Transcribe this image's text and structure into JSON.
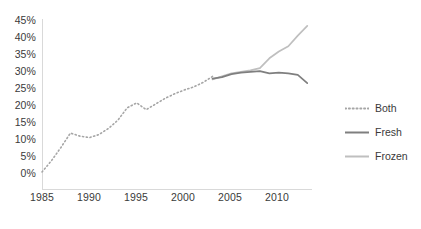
{
  "chart_data": {
    "type": "line",
    "title": "",
    "subtitle": "",
    "xlabel": "",
    "ylabel": "",
    "xlim": [
      1985,
      2013.5
    ],
    "ylim": [
      0,
      45
    ],
    "grid": false,
    "legend_position": "right",
    "x_tick_labels": [
      "1985",
      "1990",
      "1995",
      "2000",
      "2005",
      "2010"
    ],
    "x_ticks": [
      1985,
      1990,
      1995,
      2000,
      2005,
      2010
    ],
    "y_tick_labels": [
      "0%",
      "5%",
      "10%",
      "15%",
      "20%",
      "25%",
      "30%",
      "35%",
      "40%",
      "45%"
    ],
    "y_ticks": [
      0,
      5,
      10,
      15,
      20,
      25,
      30,
      35,
      40,
      45
    ],
    "series": [
      {
        "name": "Both",
        "style": "dotted",
        "color": "#a6a6a6",
        "x": [
          1985,
          1986,
          1987,
          1988,
          1989,
          1990,
          1991,
          1992,
          1993,
          1994,
          1995,
          1996,
          1997,
          1998,
          1999,
          2000,
          2001,
          2002,
          2003
        ],
        "values": [
          4.5,
          7.5,
          11.0,
          14.8,
          14.0,
          13.6,
          14.4,
          16.0,
          18.2,
          21.5,
          22.8,
          21.0,
          22.5,
          24.0,
          25.2,
          26.2,
          27.0,
          28.2,
          29.8
        ]
      },
      {
        "name": "Fresh",
        "style": "solid",
        "color": "#7f7f7f",
        "x": [
          2003,
          2004,
          2005,
          2006,
          2007,
          2008,
          2009,
          2010,
          2011,
          2012,
          2013
        ],
        "values": [
          29.2,
          29.6,
          30.4,
          30.8,
          31.0,
          31.2,
          30.6,
          30.8,
          30.6,
          30.2,
          28.0
        ]
      },
      {
        "name": "Frozen",
        "style": "solid",
        "color": "#bfbfbf",
        "x": [
          2003,
          2004,
          2005,
          2006,
          2007,
          2008,
          2009,
          2010,
          2011,
          2012,
          2013
        ],
        "values": [
          29.0,
          29.8,
          30.6,
          31.0,
          31.4,
          32.0,
          34.6,
          36.4,
          37.8,
          40.6,
          43.2
        ]
      }
    ]
  },
  "legend": {
    "items": [
      {
        "label": "Both"
      },
      {
        "label": "Fresh"
      },
      {
        "label": "Frozen"
      }
    ]
  },
  "axes": {
    "y_labels": [
      "45%",
      "40%",
      "35%",
      "30%",
      "25%",
      "20%",
      "15%",
      "10%",
      "5%",
      "0%"
    ],
    "x_labels": [
      "1985",
      "1990",
      "1995",
      "2000",
      "2005",
      "2010"
    ]
  },
  "colors": {
    "both": "#a6a6a6",
    "fresh": "#7f7f7f",
    "frozen": "#bfbfbf",
    "axis": "#d9d9d9",
    "text": "#3a3a3a",
    "background": "#ffffff"
  }
}
